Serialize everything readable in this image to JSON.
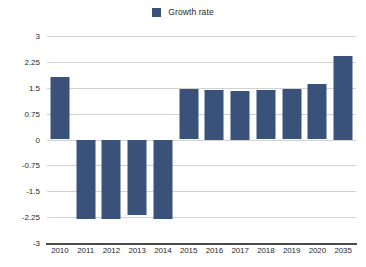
{
  "chart_data": {
    "type": "bar",
    "title": "",
    "subtitle": "",
    "xlabel": "",
    "ylabel": "",
    "legend_position": "top-center",
    "grid": true,
    "ylim": [
      -3,
      3
    ],
    "yticks": [
      "3",
      "2.25",
      "1.5",
      "0.75",
      "0",
      "-0.75",
      "-1.5",
      "-2.25",
      "-3"
    ],
    "ytick_values": [
      3,
      2.25,
      1.5,
      0.75,
      0,
      -0.75,
      -1.5,
      -2.25,
      -3
    ],
    "categories": [
      "2010",
      "2011",
      "2012",
      "2013",
      "2014",
      "2015",
      "2016",
      "2017",
      "2018",
      "2019",
      "2020",
      "2035"
    ],
    "series": [
      {
        "name": "Growth rate",
        "color": "#3a5279",
        "values": [
          1.82,
          -2.3,
          -2.3,
          -2.2,
          -2.3,
          1.46,
          1.45,
          1.42,
          1.44,
          1.47,
          1.62,
          2.42
        ]
      }
    ]
  },
  "legend": {
    "items": [
      {
        "label": "Growth rate",
        "color": "#3a5279",
        "swatch": "square-swatch"
      }
    ]
  },
  "colors": {
    "bar": "#3a5279",
    "gridline": "#d2d2d2",
    "axis": "#4c4c4c",
    "background": "#ffffff",
    "text": "#1f1f1f"
  }
}
